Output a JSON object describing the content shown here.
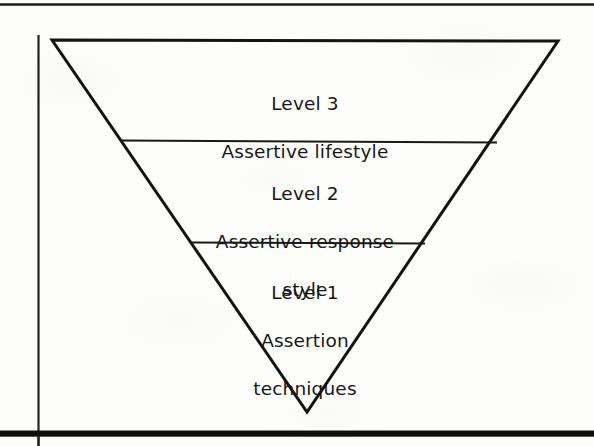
{
  "figure": {
    "type": "inverted-triangle-hierarchy",
    "shape_label": "inverted triangle",
    "background_color": "#fdfdfb",
    "stroke_color": "#141414",
    "text_color": "#171717",
    "canvas": {
      "width": 594,
      "height": 446
    },
    "rules": {
      "top_rule_label": "top horizontal rule",
      "left_rule_label": "left vertical rule",
      "bottom_bar_label": "bottom thick black bar"
    },
    "triangle": {
      "top_left": [
        52,
        40
      ],
      "top_right": [
        558,
        41
      ],
      "apex": [
        307,
        412
      ],
      "stroke_width": 3
    },
    "dividers": [
      {
        "name": "divider-level3-level2",
        "x1": 122,
        "y1": 141,
        "x2": 497,
        "y2": 143,
        "stroke_width": 2
      },
      {
        "name": "divider-level2-level1",
        "x1": 190,
        "y1": 243,
        "x2": 425,
        "y2": 244,
        "stroke_width": 2
      }
    ],
    "levels": [
      {
        "id": "level3",
        "band": "top",
        "heading": "Level 3",
        "description": "Assertive lifestyle",
        "lines": [
          "Level 3",
          "Assertive lifestyle"
        ]
      },
      {
        "id": "level2",
        "band": "middle",
        "heading": "Level 2",
        "description": "Assertive response style",
        "lines": [
          "Level 2",
          "Assertive response",
          "style"
        ]
      },
      {
        "id": "level1",
        "band": "bottom",
        "heading": "Level 1",
        "description": "Assertion techniques",
        "lines": [
          "Level 1",
          "Assertion",
          "techniques"
        ]
      }
    ]
  }
}
